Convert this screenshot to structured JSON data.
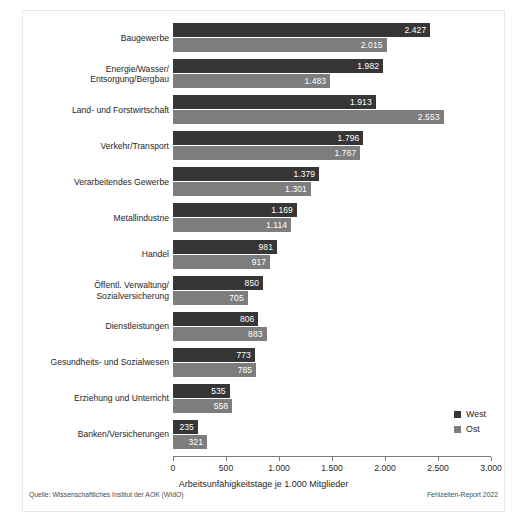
{
  "chart_data": {
    "type": "bar",
    "orientation": "horizontal",
    "title": "",
    "xlabel": "Arbeitsunfähigkeitstage je 1.000 Mitglieder",
    "ylabel": "",
    "xlim": [
      0,
      3000
    ],
    "xticks": [
      0,
      500,
      1000,
      1500,
      2000,
      2500,
      3000
    ],
    "xtick_labels": [
      "0",
      "500",
      "1.000",
      "1.500",
      "2.000",
      "2.500",
      "3.000"
    ],
    "grid": false,
    "legend_position": "bottom-right",
    "categories": [
      "Baugewerbe",
      "Energie/Wasser/\nEntsorgung/Bergbau",
      "Land- und Forstwirtschaft",
      "Verkehr/Transport",
      "Verarbeitendes Gewerbe",
      "Metallindustrie",
      "Handel",
      "Öffentl. Verwaltung/\nSozialversicherung",
      "Dienstleistungen",
      "Gesundheits- und Sozialwesen",
      "Erziehung und Unterricht",
      "Banken/Versicherungen"
    ],
    "series": [
      {
        "name": "West",
        "color": "#363636",
        "values": [
          2427,
          1982,
          1913,
          1796,
          1379,
          1169,
          981,
          850,
          806,
          773,
          535,
          235
        ],
        "value_labels": [
          "2.427",
          "1.982",
          "1.913",
          "1.796",
          "1.379",
          "1.169",
          "981",
          "850",
          "806",
          "773",
          "535",
          "235"
        ]
      },
      {
        "name": "Ost",
        "color": "#7d7d7d",
        "values": [
          2015,
          1483,
          2553,
          1767,
          1301,
          1114,
          917,
          705,
          883,
          785,
          558,
          321
        ],
        "value_labels": [
          "2.015",
          "1.483",
          "2.553",
          "1.767",
          "1.301",
          "1.114",
          "917",
          "705",
          "883",
          "785",
          "558",
          "321"
        ]
      }
    ]
  },
  "legend": {
    "items": [
      {
        "label": "West",
        "color": "#363636"
      },
      {
        "label": "Ost",
        "color": "#7d7d7d"
      }
    ]
  },
  "footer": {
    "source": "Quelle: Wissenschaftliches Institut der AOK (WIdO)",
    "report": "Fehlzeiten-Report 2022"
  }
}
